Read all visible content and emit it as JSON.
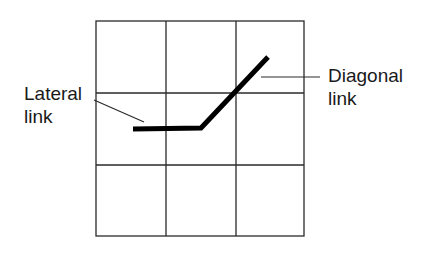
{
  "diagram": {
    "type": "grid-link-illustration",
    "grid": {
      "rows": 3,
      "cols": 3,
      "x": [
        96,
        166,
        236,
        304
      ],
      "y": [
        21,
        93,
        165,
        236
      ],
      "stroke": "#2a2a2a"
    },
    "path": {
      "points": "133,129 201,128 268,57",
      "stroke": "#000000",
      "width": 5
    },
    "labels": {
      "lateral": {
        "line1": "Lateral",
        "line2": "link",
        "leader": {
          "x1": 94,
          "y1": 100,
          "x2": 144,
          "y2": 122
        }
      },
      "diagonal": {
        "line1": "Diagonal",
        "line2": "link",
        "leader": {
          "x1": 261,
          "y1": 77,
          "x2": 320,
          "y2": 77
        }
      }
    }
  }
}
